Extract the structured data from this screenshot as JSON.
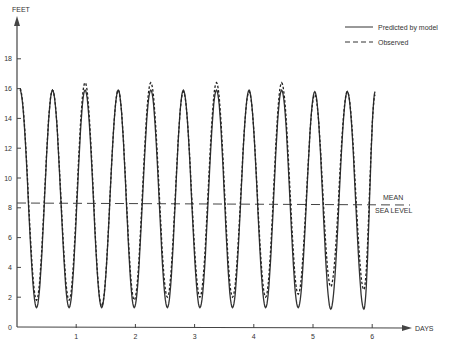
{
  "chart_data": {
    "type": "line",
    "title": "",
    "xlabel": "DAYS",
    "ylabel": "FEET",
    "xlim": [
      0,
      7
    ],
    "ylim": [
      0,
      20
    ],
    "x_ticks": [
      1,
      2,
      3,
      4,
      5,
      6
    ],
    "y_ticks": [
      0,
      2,
      4,
      6,
      8,
      10,
      12,
      14,
      16,
      18
    ],
    "grid": false,
    "legend_position": "top-right",
    "legend": [
      {
        "label": "Predicted by model",
        "style": "solid"
      },
      {
        "label": "Observed",
        "style": "dashed"
      }
    ],
    "annotations": [
      {
        "text": "MEAN",
        "x": 6.1,
        "y": 8.3
      },
      {
        "text": "SEA LEVEL",
        "x": 6.1,
        "y": 8.3
      }
    ],
    "mean_sea_level": 8.3,
    "period_days": 0.553,
    "first_peak_day": 0.05,
    "series": [
      {
        "name": "Predicted by model",
        "style": "solid",
        "extrema": [
          {
            "x": 0.05,
            "y": 15.9
          },
          {
            "x": 0.33,
            "y": 1.3
          },
          {
            "x": 0.6,
            "y": 15.9
          },
          {
            "x": 0.88,
            "y": 1.3
          },
          {
            "x": 1.15,
            "y": 15.9
          },
          {
            "x": 1.43,
            "y": 1.3
          },
          {
            "x": 1.71,
            "y": 15.9
          },
          {
            "x": 1.98,
            "y": 1.3
          },
          {
            "x": 2.26,
            "y": 15.9
          },
          {
            "x": 2.54,
            "y": 1.3
          },
          {
            "x": 2.81,
            "y": 15.9
          },
          {
            "x": 3.09,
            "y": 1.3
          },
          {
            "x": 3.37,
            "y": 15.9
          },
          {
            "x": 3.64,
            "y": 1.3
          },
          {
            "x": 3.92,
            "y": 15.9
          },
          {
            "x": 4.2,
            "y": 1.3
          },
          {
            "x": 4.47,
            "y": 15.9
          },
          {
            "x": 4.75,
            "y": 1.3
          },
          {
            "x": 5.03,
            "y": 15.8
          },
          {
            "x": 5.3,
            "y": 1.2
          },
          {
            "x": 5.58,
            "y": 15.8
          },
          {
            "x": 5.86,
            "y": 1.2
          },
          {
            "x": 6.05,
            "y": 15.8
          }
        ]
      },
      {
        "name": "Observed",
        "style": "dashed",
        "extrema": [
          {
            "x": 0.05,
            "y": 16.0
          },
          {
            "x": 0.33,
            "y": 1.8
          },
          {
            "x": 0.6,
            "y": 15.9
          },
          {
            "x": 0.88,
            "y": 1.8
          },
          {
            "x": 1.15,
            "y": 16.4
          },
          {
            "x": 1.43,
            "y": 1.4
          },
          {
            "x": 1.71,
            "y": 15.9
          },
          {
            "x": 1.98,
            "y": 1.8
          },
          {
            "x": 2.26,
            "y": 16.4
          },
          {
            "x": 2.54,
            "y": 2.0
          },
          {
            "x": 2.81,
            "y": 15.8
          },
          {
            "x": 3.09,
            "y": 2.0
          },
          {
            "x": 3.37,
            "y": 16.4
          },
          {
            "x": 3.64,
            "y": 2.0
          },
          {
            "x": 3.92,
            "y": 15.8
          },
          {
            "x": 4.2,
            "y": 2.0
          },
          {
            "x": 4.47,
            "y": 16.4
          },
          {
            "x": 4.75,
            "y": 2.2
          },
          {
            "x": 5.03,
            "y": 15.6
          },
          {
            "x": 5.3,
            "y": 2.7
          },
          {
            "x": 5.58,
            "y": 15.8
          },
          {
            "x": 5.86,
            "y": 2.5
          },
          {
            "x": 6.05,
            "y": 15.6
          }
        ]
      }
    ]
  },
  "labels": {
    "y_axis": "FEET",
    "x_axis": "DAYS",
    "legend_predicted": "Predicted by model",
    "legend_observed": "Observed",
    "msl_line1": "MEAN",
    "msl_line2": "SEA LEVEL"
  }
}
